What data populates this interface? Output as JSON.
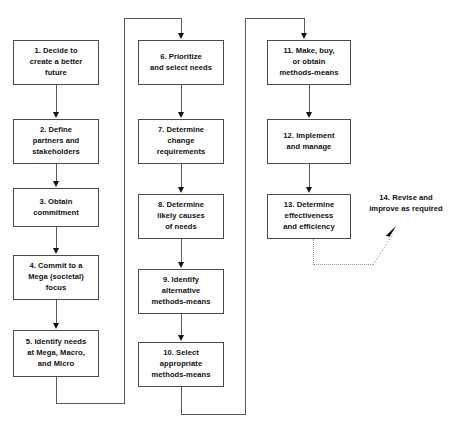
{
  "title": "",
  "document": {
    "kind": "flowchart",
    "orientation": "three-column snake",
    "background_color": "#ffffff",
    "line_color": "#5a5a5a",
    "text_color": "#111111",
    "dotted_line_color": "#9a9a9a"
  },
  "columns": [
    {
      "id": "column-1",
      "nodes": [
        "n1",
        "n2",
        "n3",
        "n4",
        "n5"
      ]
    },
    {
      "id": "column-2",
      "nodes": [
        "n6",
        "n7",
        "n8",
        "n9",
        "n10"
      ]
    },
    {
      "id": "column-3",
      "nodes": [
        "n11",
        "n12",
        "n13",
        "n14"
      ]
    }
  ],
  "nodes": {
    "n1": {
      "number": "1.",
      "text": "1. Decide to create a better future",
      "lines": [
        "1. Decide to",
        "create a better",
        "future"
      ],
      "boxed": true
    },
    "n2": {
      "number": "2.",
      "text": "2. Define partners and stakeholders",
      "lines": [
        "2. Define",
        "partners and",
        "stakeholders"
      ],
      "boxed": true
    },
    "n3": {
      "number": "3.",
      "text": "3. Obtain commitment",
      "lines": [
        "3. Obtain",
        "commitment"
      ],
      "boxed": true
    },
    "n4": {
      "number": "4.",
      "text": "4. Commit to a Mega (societal) focus",
      "lines": [
        "4. Commit to a",
        "Mega (societal)",
        "focus"
      ],
      "boxed": true
    },
    "n5": {
      "number": "5.",
      "text": "5. Identify needs at Mega, Macro, and Micro",
      "lines": [
        "5. Identify needs",
        "at Mega, Macro,",
        "and Micro"
      ],
      "boxed": true
    },
    "n6": {
      "number": "6.",
      "text": "6. Prioritize and select needs",
      "lines": [
        "6. Prioritize",
        "and select needs"
      ],
      "boxed": true
    },
    "n7": {
      "number": "7.",
      "text": "7. Determine change requirements",
      "lines": [
        "7. Determine",
        "change",
        "requirements"
      ],
      "boxed": true
    },
    "n8": {
      "number": "8.",
      "text": "8. Determine likely causes of needs",
      "lines": [
        "8. Determine",
        "likely causes",
        "of needs"
      ],
      "boxed": true
    },
    "n9": {
      "number": "9.",
      "text": "9. Identify alternative methods-means",
      "lines": [
        "9. Identify",
        "alternative",
        "methods-means"
      ],
      "boxed": true
    },
    "n10": {
      "number": "10.",
      "text": "10. Select appropriate methods-means",
      "lines": [
        "10. Select",
        "appropriate",
        "methods-means"
      ],
      "boxed": true
    },
    "n11": {
      "number": "11.",
      "text": "11. Make, buy, or obtain methods-means",
      "lines": [
        "11. Make, buy,",
        "or obtain",
        "methods-means"
      ],
      "boxed": true
    },
    "n12": {
      "number": "12.",
      "text": "12. Implement and manage",
      "lines": [
        "12. Implement",
        "and manage"
      ],
      "boxed": true
    },
    "n13": {
      "number": "13.",
      "text": "13. Determine effectiveness and efficiency",
      "lines": [
        "13. Determine",
        "effectiveness",
        "and efficiency"
      ],
      "boxed": true
    },
    "n14": {
      "number": "14.",
      "text": "14. Revise and improve as required",
      "lines": [
        "14. Revise and",
        "improve as",
        "required"
      ],
      "boxed": false
    }
  },
  "edges": [
    {
      "from": "n1",
      "to": "n2",
      "style": "solid",
      "arrow": true
    },
    {
      "from": "n2",
      "to": "n3",
      "style": "solid",
      "arrow": true
    },
    {
      "from": "n3",
      "to": "n4",
      "style": "solid",
      "arrow": true
    },
    {
      "from": "n4",
      "to": "n5",
      "style": "solid",
      "arrow": true
    },
    {
      "from": "n5",
      "to": "n6",
      "style": "solid",
      "arrow": true,
      "route": "down-right-up-right-down"
    },
    {
      "from": "n6",
      "to": "n7",
      "style": "solid",
      "arrow": true
    },
    {
      "from": "n7",
      "to": "n8",
      "style": "solid",
      "arrow": true
    },
    {
      "from": "n8",
      "to": "n9",
      "style": "solid",
      "arrow": true
    },
    {
      "from": "n9",
      "to": "n10",
      "style": "solid",
      "arrow": true
    },
    {
      "from": "n10",
      "to": "n11",
      "style": "solid",
      "arrow": true,
      "route": "down-right-up-right-down"
    },
    {
      "from": "n11",
      "to": "n12",
      "style": "solid",
      "arrow": true
    },
    {
      "from": "n12",
      "to": "n13",
      "style": "solid",
      "arrow": true
    },
    {
      "from": "n13",
      "to": "n14",
      "style": "dotted",
      "arrow": true,
      "route": "down-right-diagonal-up"
    }
  ]
}
